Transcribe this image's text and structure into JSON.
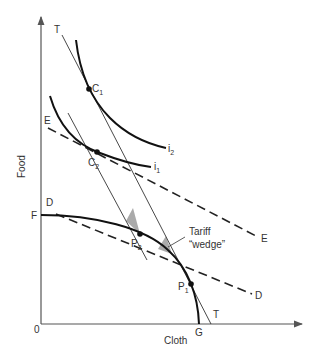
{
  "diagram": {
    "type": "trade-diagram",
    "axes": {
      "x_label": "Cloth",
      "y_label": "Food",
      "origin_label": "0"
    },
    "curves": {
      "ppf": {
        "start_label": "F",
        "end_label": "G"
      },
      "indifference_high": {
        "label": "i",
        "sub": "2"
      },
      "indifference_low": {
        "label": "i",
        "sub": "1"
      }
    },
    "lines": {
      "world_price": {
        "label_top": "T",
        "label_bottom": "T"
      },
      "line_e": {
        "label_left": "E",
        "label_right": "E"
      },
      "line_d": {
        "label_left": "D",
        "label_right": "D"
      }
    },
    "points": {
      "c1": {
        "label": "C",
        "sub": "1"
      },
      "c2": {
        "label": "C",
        "sub": "2"
      },
      "p1": {
        "label": "P",
        "sub": "1"
      },
      "p2": {
        "label": "P",
        "sub": "2"
      }
    },
    "annotation": {
      "line1": "Tariff",
      "line2": "“wedge”"
    },
    "colors": {
      "line": "#222222",
      "axis": "#555555",
      "wedge": "#aaaaaa",
      "text": "#333333"
    }
  }
}
